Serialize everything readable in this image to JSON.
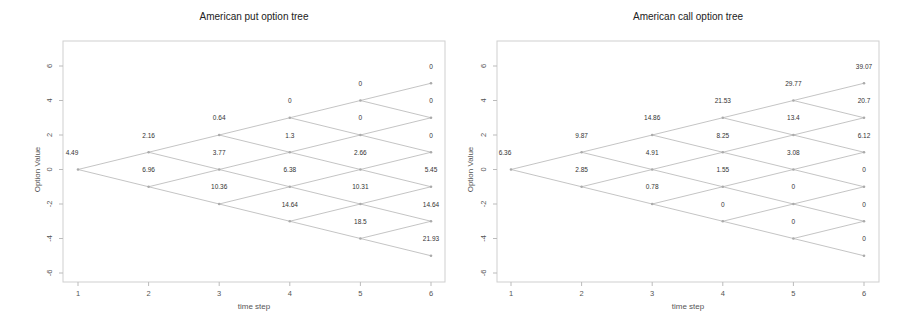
{
  "chart_data": [
    {
      "type": "scatter",
      "subtype": "binomial-tree",
      "title": "American put option tree",
      "xlabel": "time step",
      "ylabel": "Option Value",
      "x_ticks": [
        1,
        2,
        3,
        4,
        5,
        6
      ],
      "y_ticks": [
        -6,
        -4,
        -2,
        0,
        2,
        4,
        6
      ],
      "xlim": [
        0.8,
        6.2
      ],
      "ylim": [
        -6.5,
        6.5
      ],
      "grid": false,
      "steps": [
        {
          "t": 1,
          "values": [
            4.49
          ]
        },
        {
          "t": 2,
          "values": [
            2.16,
            6.96
          ]
        },
        {
          "t": 3,
          "values": [
            0.64,
            3.77,
            10.36
          ]
        },
        {
          "t": 4,
          "values": [
            0,
            1.3,
            6.38,
            14.64
          ]
        },
        {
          "t": 5,
          "values": [
            0,
            0,
            2.66,
            10.31,
            18.5
          ]
        },
        {
          "t": 6,
          "values": [
            0,
            0,
            0,
            5.45,
            14.64,
            21.93
          ]
        }
      ]
    },
    {
      "type": "scatter",
      "subtype": "binomial-tree",
      "title": "American call option tree",
      "xlabel": "time step",
      "ylabel": "Option Value",
      "x_ticks": [
        1,
        2,
        3,
        4,
        5,
        6
      ],
      "y_ticks": [
        -6,
        -4,
        -2,
        0,
        2,
        4,
        6
      ],
      "xlim": [
        0.8,
        6.2
      ],
      "ylim": [
        -6.5,
        6.5
      ],
      "grid": false,
      "steps": [
        {
          "t": 1,
          "values": [
            6.36
          ]
        },
        {
          "t": 2,
          "values": [
            9.87,
            2.85
          ]
        },
        {
          "t": 3,
          "values": [
            14.86,
            4.91,
            0.78
          ]
        },
        {
          "t": 4,
          "values": [
            21.53,
            8.25,
            1.55,
            0
          ]
        },
        {
          "t": 5,
          "values": [
            29.77,
            13.4,
            3.08,
            0,
            0
          ]
        },
        {
          "t": 6,
          "values": [
            39.07,
            20.7,
            6.12,
            0,
            0,
            0
          ]
        }
      ]
    }
  ],
  "charts": [
    {
      "title": "American put option tree",
      "xlabel": "time step",
      "ylabel": "Option Value"
    },
    {
      "title": "American call option tree",
      "xlabel": "time step",
      "ylabel": "Option Value"
    }
  ],
  "colors": {
    "edge": "#bdbdbd",
    "node": "#aaaaaa",
    "frame": "#cfcfcf",
    "text": "#333333"
  }
}
